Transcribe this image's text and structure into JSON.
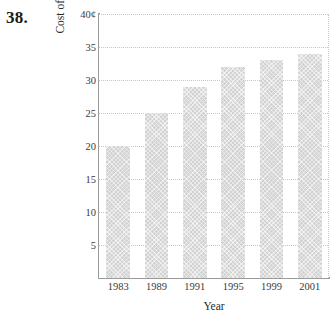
{
  "problem": {
    "number": "38."
  },
  "chart_data": {
    "type": "bar",
    "title": "",
    "categories": [
      "1983",
      "1989",
      "1991",
      "1995",
      "1999",
      "2001"
    ],
    "values": [
      20,
      25,
      29,
      32,
      33,
      34
    ],
    "xlabel": "Year",
    "ylabel": "Cost of first-class postage",
    "ylim": [
      0,
      40
    ],
    "yticks": [
      5,
      10,
      15,
      20,
      25,
      30,
      35,
      40
    ],
    "ytick_labels": [
      "5",
      "10",
      "15",
      "20",
      "25",
      "30",
      "35",
      "40¢"
    ],
    "grid": true,
    "legend": "none",
    "bar_color": "#d2d2d2",
    "axis_color": "#9a9a9a",
    "grid_color": "#c6c6c6"
  }
}
